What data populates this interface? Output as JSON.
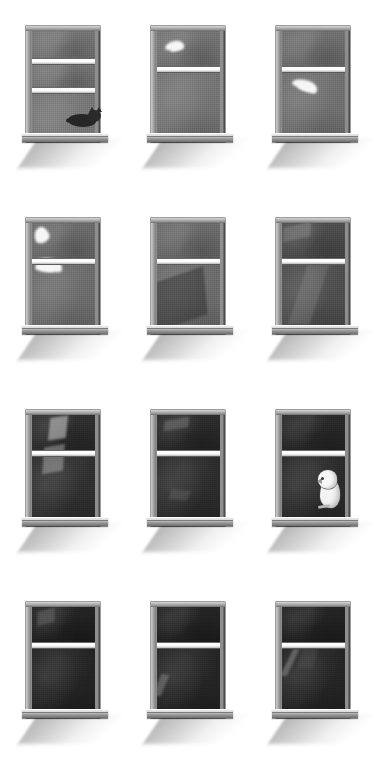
{
  "artwork": {
    "title": "Twelve Windows",
    "medium": "graphite-and-ink illustration",
    "background_color": "#ffffff",
    "grid": {
      "rows": 4,
      "columns": 3,
      "count": 12
    },
    "palette": {
      "paper": "#ffffff",
      "frame_light": "#d6d6d6",
      "frame_mid": "#8e8e8e",
      "frame_dark": "#4a4a4a",
      "sash_rail": "#ffffff",
      "sky_day": "#757575",
      "sky_dusk": "#5e5e5e",
      "sky_night": "#2a2a2a",
      "cloud": "#f6f6f6",
      "shadow": "#b4b4b4",
      "cat": "#262626",
      "bird": "#f4f4f4"
    }
  },
  "windows": [
    {
      "id": 1,
      "row": 1,
      "col": 1,
      "label": "window-1-cat-on-sill",
      "sash_position": "raised",
      "panes": 3,
      "sky_tone": "#757575",
      "subject": "cat",
      "subject_label": "sleeping cat on sill",
      "clouds": [],
      "beams": []
    },
    {
      "id": 2,
      "row": 1,
      "col": 2,
      "label": "window-2-cloud-upper-pane",
      "sash_position": "closed",
      "panes": 2,
      "sky_tone": "#737373",
      "subject": "none",
      "subject_label": "empty",
      "clouds": [
        {
          "x": 14,
          "y": 10,
          "w": 30,
          "h": 9,
          "rot": -8
        },
        {
          "x": 22,
          "y": 14,
          "w": 22,
          "h": 6,
          "rot": -14
        }
      ],
      "beams": []
    },
    {
      "id": 3,
      "row": 1,
      "col": 3,
      "label": "window-3-cloud-lower-pane",
      "sash_position": "closed",
      "panes": 2,
      "sky_tone": "#6f6f6f",
      "subject": "none",
      "subject_label": "empty",
      "clouds": [
        {
          "x": 16,
          "y": 48,
          "w": 42,
          "h": 10,
          "rot": 18
        },
        {
          "x": 26,
          "y": 53,
          "w": 30,
          "h": 7,
          "rot": 20
        }
      ],
      "beams": []
    },
    {
      "id": 4,
      "row": 2,
      "col": 1,
      "label": "window-4-large-cloud",
      "sash_position": "closed",
      "panes": 2,
      "sky_tone": "#6b6b6b",
      "subject": "none",
      "subject_label": "empty",
      "clouds": [
        {
          "x": 4,
          "y": 4,
          "w": 24,
          "h": 16,
          "rot": -22
        },
        {
          "x": 6,
          "y": 34,
          "w": 44,
          "h": 13,
          "rot": 16
        },
        {
          "x": 5,
          "y": 40,
          "w": 30,
          "h": 8,
          "rot": 10
        }
      ],
      "beams": []
    },
    {
      "id": 5,
      "row": 2,
      "col": 2,
      "label": "window-5-diagonal-horizon",
      "sash_position": "closed",
      "panes": 2,
      "sky_tone": "#6a6a6a",
      "subject": "none",
      "subject_label": "empty",
      "clouds": [],
      "beams": [
        {
          "x": -10,
          "y": 52,
          "w": 90,
          "h": 46,
          "rot": -19,
          "tone": "rgba(30,30,30,.40)"
        }
      ]
    },
    {
      "id": 6,
      "row": 2,
      "col": 3,
      "label": "window-6-dusk-shape",
      "sash_position": "closed",
      "panes": 2,
      "sky_tone": "#4d4d4d",
      "subject": "none",
      "subject_label": "empty",
      "clouds": [],
      "beams": [
        {
          "x": 26,
          "y": 40,
          "w": 34,
          "h": 60,
          "rot": 4,
          "tone": "rgba(190,190,190,.16)"
        },
        {
          "x": 2,
          "y": 2,
          "w": 44,
          "h": 14,
          "rot": -12,
          "tone": "rgba(200,200,200,.20)"
        }
      ]
    },
    {
      "id": 7,
      "row": 3,
      "col": 1,
      "label": "window-7-light-beam",
      "sash_position": "closed",
      "panes": 2,
      "sky_tone": "#2f2f2f",
      "subject": "none",
      "subject_label": "empty",
      "clouds": [],
      "beams": [
        {
          "x": 28,
          "y": 2,
          "w": 28,
          "h": 22,
          "rot": -8,
          "tone": "rgba(205,205,205,.55)"
        },
        {
          "x": 18,
          "y": 30,
          "w": 34,
          "h": 25,
          "rot": -10,
          "tone": "rgba(185,185,185,.45)"
        }
      ]
    },
    {
      "id": 8,
      "row": 3,
      "col": 2,
      "label": "window-8-faint-glow",
      "sash_position": "closed",
      "panes": 2,
      "sky_tone": "#2b2b2b",
      "subject": "none",
      "subject_label": "empty",
      "clouds": [],
      "beams": [
        {
          "x": 12,
          "y": 4,
          "w": 40,
          "h": 10,
          "rot": -10,
          "tone": "rgba(160,160,160,.30)"
        },
        {
          "x": 22,
          "y": 74,
          "w": 30,
          "h": 10,
          "rot": 6,
          "tone": "rgba(140,140,140,.22)"
        }
      ]
    },
    {
      "id": 9,
      "row": 3,
      "col": 3,
      "label": "window-9-bird-on-sill",
      "sash_position": "closed",
      "panes": 2,
      "sky_tone": "#2a2a2a",
      "subject": "bird",
      "subject_label": "white owl perched on sill",
      "clouds": [],
      "beams": []
    },
    {
      "id": 10,
      "row": 4,
      "col": 1,
      "label": "window-10-night-patch",
      "sash_position": "closed",
      "panes": 2,
      "sky_tone": "#232323",
      "subject": "none",
      "subject_label": "empty",
      "clouds": [],
      "beams": [
        {
          "x": 8,
          "y": 3,
          "w": 28,
          "h": 14,
          "rot": -14,
          "tone": "rgba(150,150,150,.28)"
        }
      ]
    },
    {
      "id": 11,
      "row": 4,
      "col": 2,
      "label": "window-11-night-streak",
      "sash_position": "closed",
      "panes": 2,
      "sky_tone": "#242424",
      "subject": "none",
      "subject_label": "empty",
      "clouds": [],
      "beams": [
        {
          "x": 1,
          "y": 66,
          "w": 12,
          "h": 22,
          "rot": 8,
          "tone": "rgba(175,175,175,.34)"
        }
      ]
    },
    {
      "id": 12,
      "row": 4,
      "col": 3,
      "label": "window-12-night-streak-right",
      "sash_position": "closed",
      "panes": 2,
      "sky_tone": "#242424",
      "subject": "none",
      "subject_label": "empty",
      "clouds": [],
      "beams": [
        {
          "x": 8,
          "y": 40,
          "w": 10,
          "h": 28,
          "rot": 12,
          "tone": "rgba(180,180,180,.36)"
        },
        {
          "x": 30,
          "y": 38,
          "w": 26,
          "h": 22,
          "rot": 0,
          "tone": "rgba(120,120,120,.16)"
        }
      ]
    }
  ]
}
